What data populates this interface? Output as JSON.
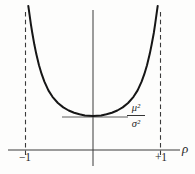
{
  "figure": {
    "background": "#fdfdfc",
    "ink": "#2a2a2a",
    "curve_color": "#161616",
    "xlabel": "ρ",
    "ticks": {
      "left": "−1",
      "right": "+1"
    },
    "min_fraction": {
      "numerator": "μ²",
      "denominator": "σ²"
    }
  },
  "chart_data": {
    "type": "line",
    "title": "",
    "xlabel": "ρ",
    "ylabel": "",
    "xlim": [
      -1.26,
      1.5
    ],
    "x_ticks": [
      -1,
      1
    ],
    "x_tick_labels": [
      "−1",
      "+1"
    ],
    "grid": false,
    "legend": false,
    "asymptotes_x": [
      -1,
      1
    ],
    "minimum": {
      "rho": 0,
      "value_label": "μ²/σ²",
      "value_units": 1.0
    },
    "annotation": {
      "text": "μ²/σ²",
      "meaning": "minimum value of the curve, attained at ρ = 0, marked by a short horizontal tangent line"
    },
    "series": [
      {
        "name": "U-shaped curve with vertical asymptotes at ρ = ±1",
        "x_units": "ρ (correlation coefficient)",
        "y_units": "multiples of μ²/σ²",
        "points": [
          [
            -0.958,
            4.238
          ],
          [
            -0.95,
            4.114
          ],
          [
            -0.94,
            3.968
          ],
          [
            -0.92,
            3.693
          ],
          [
            -0.9,
            3.442
          ],
          [
            -0.87,
            3.109
          ],
          [
            -0.84,
            2.82
          ],
          [
            -0.8,
            2.495
          ],
          [
            -0.76,
            2.229
          ],
          [
            -0.72,
            2.01
          ],
          [
            -0.66,
            1.754
          ],
          [
            -0.6,
            1.564
          ],
          [
            -0.52,
            1.381
          ],
          [
            -0.44,
            1.254
          ],
          [
            -0.36,
            1.163
          ],
          [
            -0.28,
            1.096
          ],
          [
            -0.2,
            1.049
          ],
          [
            -0.12,
            1.017
          ],
          [
            0,
            1.0
          ],
          [
            0.12,
            1.017
          ],
          [
            0.2,
            1.049
          ],
          [
            0.28,
            1.096
          ],
          [
            0.36,
            1.163
          ],
          [
            0.44,
            1.254
          ],
          [
            0.52,
            1.381
          ],
          [
            0.6,
            1.564
          ],
          [
            0.66,
            1.754
          ],
          [
            0.72,
            2.01
          ],
          [
            0.76,
            2.229
          ],
          [
            0.8,
            2.495
          ],
          [
            0.84,
            2.82
          ],
          [
            0.87,
            3.109
          ],
          [
            0.9,
            3.442
          ],
          [
            0.92,
            3.693
          ],
          [
            0.94,
            3.968
          ],
          [
            0.95,
            4.114
          ],
          [
            0.958,
            4.238
          ]
        ]
      }
    ]
  }
}
